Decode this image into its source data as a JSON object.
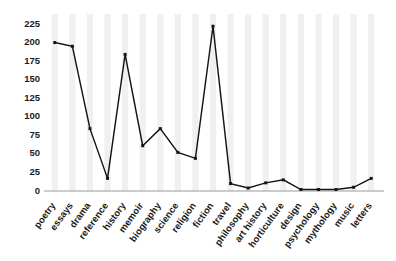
{
  "chart_data": {
    "type": "line",
    "title": "",
    "subtitle": "",
    "xlabel": "",
    "ylabel": "",
    "categories": [
      "poetry",
      "essays",
      "drama",
      "reference",
      "history",
      "memoir",
      "biography",
      "science",
      "religion",
      "fiction",
      "travel",
      "philosophy",
      "art history",
      "horticulture",
      "design",
      "psychology",
      "mythology",
      "music",
      "letters"
    ],
    "values": [
      200,
      195,
      84,
      17,
      184,
      61,
      84,
      52,
      44,
      222,
      10,
      4,
      11,
      15,
      2,
      2,
      2,
      5,
      17
    ],
    "ylim": [
      0,
      232
    ],
    "yticks": [
      0,
      25,
      50,
      75,
      100,
      125,
      150,
      175,
      200,
      225
    ],
    "ytick_labels": [
      "0",
      "25",
      "50",
      "75",
      "100",
      "125",
      "150",
      "175",
      "200",
      "225"
    ],
    "grid": "vertical-bands",
    "legend": "none",
    "marker": "square",
    "line_color": "#151515",
    "grid_color": "#f0f0f0",
    "axis_color": "#9a9a9a",
    "text_color": "#1b1b1b"
  }
}
